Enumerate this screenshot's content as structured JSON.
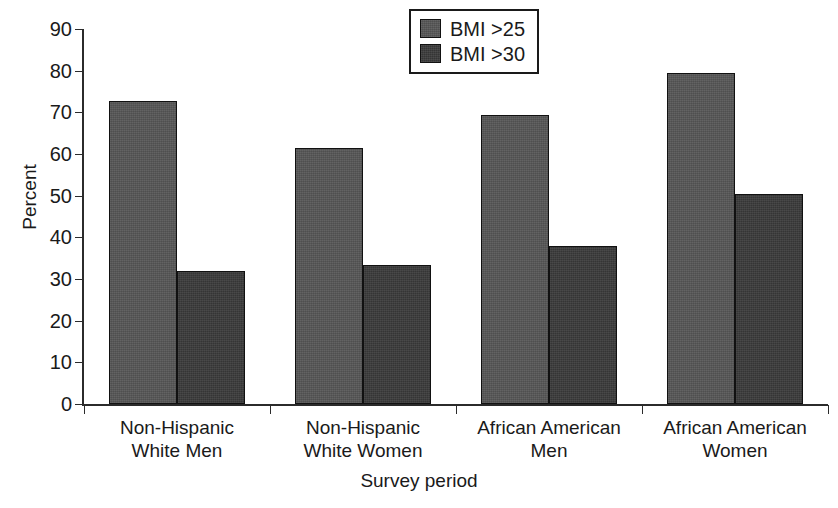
{
  "chart_data": {
    "type": "bar",
    "title": "",
    "xlabel": "Survey period",
    "ylabel": "Percent",
    "ylim": [
      0,
      90
    ],
    "ytick_step": 10,
    "yticks": [
      0,
      10,
      20,
      30,
      40,
      50,
      60,
      70,
      80,
      90
    ],
    "grid": false,
    "legend_position": "top-center",
    "categories": [
      "Non-Hispanic\nWhite Men",
      "Non-Hispanic\nWhite Women",
      "African American\nMen",
      "African American\nWomen"
    ],
    "series": [
      {
        "name": "BMI >25",
        "color": "#565656",
        "values": [
          72.8,
          61.5,
          69.3,
          79.4
        ]
      },
      {
        "name": "BMI >30",
        "color": "#3a3a3a",
        "values": [
          32.0,
          33.3,
          37.9,
          50.5
        ]
      }
    ]
  },
  "colors": {
    "series_bmi25": "#565656",
    "series_bmi30": "#3a3a3a",
    "axis": "#2b2b2b",
    "text": "#1a1a1a",
    "background": "#ffffff"
  }
}
